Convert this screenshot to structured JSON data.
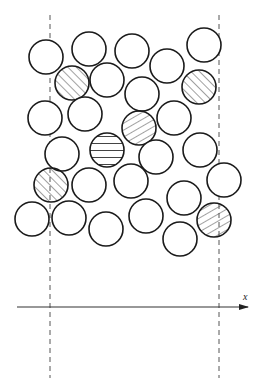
{
  "diagram": {
    "axis": {
      "label": "x",
      "x1": 17,
      "y": 307,
      "x2": 248,
      "label_x": 243,
      "label_y": 300
    },
    "boundaries": [
      {
        "name": "left-boundary",
        "x": 50,
        "y1": 15,
        "y2": 378
      },
      {
        "name": "right-boundary",
        "x": 219,
        "y1": 15,
        "y2": 378
      }
    ],
    "circle_radius": 17,
    "colors": {
      "stroke": "#1a1a1a",
      "hatch": "#444444",
      "dash": "#555555",
      "fill": "#ffffff"
    },
    "circles": [
      {
        "cx": 46,
        "cy": 57,
        "hatch": "none"
      },
      {
        "cx": 89,
        "cy": 49,
        "hatch": "none"
      },
      {
        "cx": 132,
        "cy": 51,
        "hatch": "none"
      },
      {
        "cx": 167,
        "cy": 66,
        "hatch": "none"
      },
      {
        "cx": 204,
        "cy": 45,
        "hatch": "none"
      },
      {
        "cx": 72,
        "cy": 83,
        "hatch": "diag-forward"
      },
      {
        "cx": 107,
        "cy": 80,
        "hatch": "none"
      },
      {
        "cx": 142,
        "cy": 94,
        "hatch": "none"
      },
      {
        "cx": 199,
        "cy": 87,
        "hatch": "diag-forward"
      },
      {
        "cx": 45,
        "cy": 118,
        "hatch": "none"
      },
      {
        "cx": 85,
        "cy": 114,
        "hatch": "none"
      },
      {
        "cx": 139,
        "cy": 128,
        "hatch": "diag-back"
      },
      {
        "cx": 174,
        "cy": 118,
        "hatch": "none"
      },
      {
        "cx": 62,
        "cy": 154,
        "hatch": "none"
      },
      {
        "cx": 107,
        "cy": 150,
        "hatch": "horizontal"
      },
      {
        "cx": 156,
        "cy": 157,
        "hatch": "none"
      },
      {
        "cx": 200,
        "cy": 150,
        "hatch": "none"
      },
      {
        "cx": 51,
        "cy": 185,
        "hatch": "diag-forward"
      },
      {
        "cx": 89,
        "cy": 185,
        "hatch": "none"
      },
      {
        "cx": 131,
        "cy": 181,
        "hatch": "none"
      },
      {
        "cx": 184,
        "cy": 198,
        "hatch": "none"
      },
      {
        "cx": 224,
        "cy": 180,
        "hatch": "none"
      },
      {
        "cx": 32,
        "cy": 219,
        "hatch": "none"
      },
      {
        "cx": 69,
        "cy": 218,
        "hatch": "none"
      },
      {
        "cx": 106,
        "cy": 229,
        "hatch": "none"
      },
      {
        "cx": 146,
        "cy": 216,
        "hatch": "none"
      },
      {
        "cx": 180,
        "cy": 239,
        "hatch": "none"
      },
      {
        "cx": 214,
        "cy": 220,
        "hatch": "diag-back"
      }
    ]
  }
}
